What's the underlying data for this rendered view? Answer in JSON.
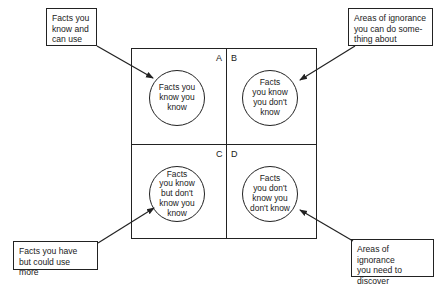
{
  "diagram": {
    "type": "quadrant-knowledge-matrix",
    "quadrants": [
      {
        "label": "A",
        "text": "Facts you know you know"
      },
      {
        "label": "B",
        "text": "Facts you know you don't know"
      },
      {
        "label": "C",
        "text": "Facts you know but don't know you know"
      },
      {
        "label": "D",
        "text": "Facts you don't know you don't know"
      }
    ],
    "callouts": {
      "top_left": "Facts you know and can use",
      "top_right": "Areas of ignorance you can do some-thing about",
      "bottom_left": "Facts you have but could use more",
      "bottom_right": "Areas of ignorance you need to discover"
    },
    "line_color": "#222222",
    "background": "#ffffff"
  },
  "lines": {
    "tl1": "Facts you",
    "tl2": "know and",
    "tl3": "can use",
    "tr1": "Areas of ignorance",
    "tr2": "you can do some-",
    "tr3": "thing about",
    "bl1": "Facts you have",
    "bl2": "but could use more",
    "br1": "Areas of ignorance",
    "br2": "you need to",
    "br3": "discover",
    "a1": "Facts you",
    "a2": "know you",
    "a3": "know",
    "b1": "Facts",
    "b2": "you know",
    "b3": "you don't",
    "b4": "know",
    "c1": "Facts",
    "c2": "you know",
    "c3": "but don't",
    "c4": "know you",
    "c5": "know",
    "d1": "Facts",
    "d2": "you don't",
    "d3": "know you",
    "d4": "don't know"
  }
}
